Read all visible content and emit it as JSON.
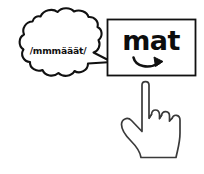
{
  "scene": {
    "title": "phonics-blending-card",
    "background_color": "#ffffff",
    "stroke_color": "#111111",
    "fill_color": "#ffffff"
  },
  "thought_bubble": {
    "name": "speech-cloud",
    "text": "/mmmääät/",
    "text_color": "#111111",
    "outline_color": "#111111",
    "fill_color": "#ffffff",
    "tail_direction": "right"
  },
  "word_card": {
    "name": "word-box",
    "word": "mat",
    "word_color": "#0d0d0d",
    "border_color": "#111111",
    "fill_color": "#ffffff",
    "arrow": {
      "name": "sweep-arrow",
      "label": "blend-left-to-right",
      "direction": "right",
      "color": "#111111"
    }
  },
  "hand": {
    "name": "pointing-hand",
    "gesture": "index-finger-up",
    "outline_color": "#3a3a3a",
    "fill_color": "#ffffff"
  }
}
